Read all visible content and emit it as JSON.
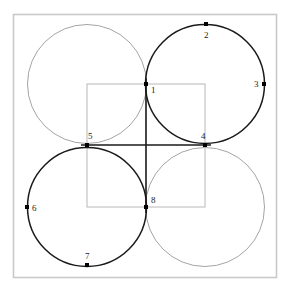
{
  "figure": {
    "canvas": {
      "width": 287,
      "height": 294,
      "background": "#ffffff"
    },
    "outer_frame": {
      "name": "outer-frame",
      "x": 13.5,
      "y": 14.5,
      "width": 263,
      "height": 263,
      "stroke": "#c9c9c9",
      "stroke_width": 1.6,
      "fill": "none"
    },
    "inner_square": {
      "name": "inner-square",
      "x": 87,
      "y": 84,
      "width": 118,
      "height": 123,
      "stroke": "#b8b8b8",
      "stroke_width": 1,
      "fill": "none",
      "corners": [
        {
          "x": 87,
          "y": 84
        },
        {
          "x": 205,
          "y": 84
        },
        {
          "x": 205,
          "y": 207
        },
        {
          "x": 87,
          "y": 207
        }
      ]
    },
    "colors": {
      "dark_stroke": "#1a1a1a",
      "light_stroke": "#9a9a9a",
      "frame_stroke": "#c9c9c9",
      "inner_square_stroke": "#b8b8b8",
      "point_fill": "#000000",
      "label_fill": "#1a1a1a",
      "background": "#ffffff"
    },
    "circles": [
      {
        "name": "circle-top-left",
        "cx": 87,
        "cy": 84,
        "r": 59.5,
        "stroke": "#9a9a9a",
        "stroke_width": 0.9,
        "shade": "light",
        "through_points": [
          "5",
          "1"
        ]
      },
      {
        "name": "circle-top-right",
        "cx": 205,
        "cy": 84,
        "r": 59.5,
        "stroke": "#1a1a1a",
        "stroke_width": 1.5,
        "shade": "dark",
        "through_points": [
          "1",
          "2",
          "3",
          "4"
        ]
      },
      {
        "name": "circle-bottom-left",
        "cx": 87,
        "cy": 207,
        "r": 59.5,
        "stroke": "#1a1a1a",
        "stroke_width": 1.5,
        "shade": "dark",
        "through_points": [
          "5",
          "6",
          "7",
          "8"
        ]
      },
      {
        "name": "circle-bottom-right",
        "cx": 205,
        "cy": 207,
        "r": 59.5,
        "stroke": "#9a9a9a",
        "stroke_width": 0.9,
        "shade": "light",
        "through_points": [
          "4",
          "8"
        ]
      }
    ],
    "axes": [
      {
        "name": "vertical-axis-1-8",
        "x1": 146,
        "y1": 78,
        "x2": 146,
        "y2": 213,
        "stroke": "#1a1a1a",
        "stroke_width": 1.6
      },
      {
        "name": "horizontal-axis-5-4",
        "x1": 81,
        "y1": 145,
        "x2": 211,
        "y2": 145,
        "stroke": "#1a1a1a",
        "stroke_width": 1.6
      }
    ],
    "points": [
      {
        "id": "1",
        "label": "1",
        "x": 146,
        "y": 84,
        "label_dx": 5,
        "label_dy": 9,
        "marker_size": 4
      },
      {
        "id": "2",
        "label": "2",
        "x": 206,
        "y": 24,
        "label_dx": -2,
        "label_dy": 14,
        "marker_size": 4
      },
      {
        "id": "3",
        "label": "3",
        "x": 264,
        "y": 84,
        "label_dx": -10,
        "label_dy": 3,
        "marker_size": 4
      },
      {
        "id": "4",
        "label": "4",
        "x": 205,
        "y": 145,
        "label_dx": -4,
        "label_dy": -6,
        "marker_size": 4
      },
      {
        "id": "5",
        "label": "5",
        "x": 87,
        "y": 145,
        "label_dx": 1,
        "label_dy": -6,
        "marker_size": 4
      },
      {
        "id": "6",
        "label": "6",
        "x": 27,
        "y": 207,
        "label_dx": 5,
        "label_dy": 4,
        "marker_size": 4
      },
      {
        "id": "7",
        "label": "7",
        "x": 87,
        "y": 265,
        "label_dx": -2,
        "label_dy": -6,
        "marker_size": 4
      },
      {
        "id": "8",
        "label": "8",
        "x": 146,
        "y": 207,
        "label_dx": 5,
        "label_dy": -4,
        "marker_size": 4
      }
    ]
  },
  "chart_data": {
    "type": "diagram",
    "labels": [
      "1",
      "2",
      "3",
      "4",
      "5",
      "6",
      "7",
      "8"
    ],
    "point_coordinates": [
      [
        146,
        84
      ],
      [
        206,
        24
      ],
      [
        264,
        84
      ],
      [
        205,
        145
      ],
      [
        87,
        145
      ],
      [
        27,
        207
      ],
      [
        87,
        265
      ],
      [
        146,
        207
      ]
    ],
    "circle_centers": [
      [
        87,
        84
      ],
      [
        205,
        84
      ],
      [
        87,
        207
      ],
      [
        205,
        207
      ]
    ],
    "circle_radius": 59.5,
    "dark_circles": [
      "circle-top-right",
      "circle-bottom-left"
    ],
    "light_circles": [
      "circle-top-left",
      "circle-bottom-right"
    ],
    "inner_square_bounds": [
      87,
      84,
      205,
      207
    ],
    "outer_frame_bounds": [
      13.5,
      14.5,
      276.5,
      277.5
    ],
    "grid": false,
    "legend": "none"
  }
}
